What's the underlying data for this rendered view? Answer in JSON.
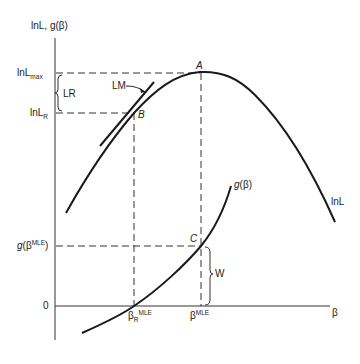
{
  "diagram": {
    "y_axis_label": "lnL, g(β)",
    "x_axis_label": "β",
    "y_ticks": {
      "lnl_max": {
        "base": "lnL",
        "sub": "max"
      },
      "lnl_r": {
        "base": "lnL",
        "sub": "R"
      },
      "g_mle": {
        "pre": "g",
        "mid": "(β",
        "sup": "MLE",
        "post": ")"
      },
      "zero": "0"
    },
    "x_ticks": {
      "beta_r_mle": {
        "base": "β",
        "sub": "R",
        "sup": "MLE"
      },
      "beta_mle": {
        "base": "β",
        "sup": "MLE"
      }
    },
    "points": {
      "a": "A",
      "b": "B",
      "c": "C"
    },
    "annotations": {
      "lr": "LR",
      "lm": "LM",
      "w": "W"
    },
    "curve_labels": {
      "lnl": "lnL",
      "g": {
        "pre": "g",
        "post": "(β)"
      }
    }
  }
}
